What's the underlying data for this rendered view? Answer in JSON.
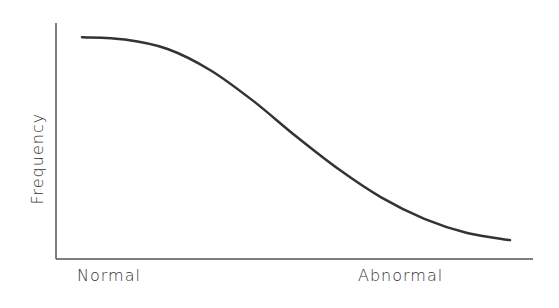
{
  "chart_data": {
    "type": "line",
    "title": "",
    "xlabel": "",
    "ylabel": "Frequency",
    "x_tick_labels": [
      "Normal",
      "Abnormal"
    ],
    "grid": false,
    "legend": null,
    "series": [
      {
        "name": "Frequency curve",
        "description": "Sigmoid-like decreasing curve from high frequency at Normal to low frequency at Abnormal",
        "x": [
          0.0,
          0.1,
          0.2,
          0.3,
          0.4,
          0.5,
          0.6,
          0.7,
          0.8,
          0.9,
          1.0
        ],
        "y": [
          0.94,
          0.93,
          0.89,
          0.8,
          0.67,
          0.52,
          0.38,
          0.26,
          0.17,
          0.11,
          0.08
        ]
      }
    ],
    "xlim": [
      0,
      1
    ],
    "ylim": [
      0,
      1
    ]
  },
  "labels": {
    "y_axis": "Frequency",
    "x_left": "Normal",
    "x_right": "Abnormal"
  },
  "colors": {
    "line": "#333333",
    "axis": "#555555"
  }
}
